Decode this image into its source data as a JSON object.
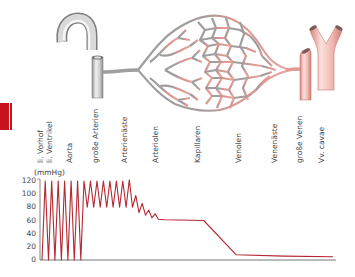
{
  "diagram": {
    "title_hint": "Blutdruck im Kreislauf",
    "vessel_labels": [
      {
        "id": "vorhof",
        "text": "li. Vorhof",
        "x": 40
      },
      {
        "id": "ventrikel",
        "text": "li. Ventrikel",
        "x": 49
      },
      {
        "id": "aorta",
        "text": "Aorta",
        "x": 69
      },
      {
        "id": "grosse-arterien",
        "text": "große Arterien",
        "x": 95
      },
      {
        "id": "arterienaeste",
        "text": "Arterienäste",
        "x": 124
      },
      {
        "id": "arteriolen",
        "text": "Arteriolen",
        "x": 155
      },
      {
        "id": "kapillaren",
        "text": "Kapillaren",
        "x": 197
      },
      {
        "id": "venolen",
        "text": "Venolen",
        "x": 238
      },
      {
        "id": "venenaeste",
        "text": "Venenäste",
        "x": 274
      },
      {
        "id": "grosse-venen",
        "text": "große Venen",
        "x": 299
      },
      {
        "id": "vv-cavae",
        "text": "Vv. cavae",
        "x": 321
      }
    ],
    "colors": {
      "accent_red": "#c8141e",
      "pressure_line": "#b42832",
      "arterial_gray": "#9a9a9a",
      "venous_pink": "#e39a93",
      "axis": "#666666"
    }
  },
  "chart_data": {
    "type": "line",
    "title": "",
    "xlabel": "",
    "ylabel": "(mmHg)",
    "ylim": [
      0,
      120
    ],
    "yticks": [
      0,
      20,
      40,
      60,
      80,
      100,
      120
    ],
    "grid": false,
    "x_segments": [
      "li. Vorhof / li. Ventrikel",
      "Aorta",
      "große Arterien",
      "Arterienäste",
      "Arteriolen",
      "Kapillaren",
      "Venolen",
      "Venenäste",
      "große Venen",
      "Vv. cavae"
    ],
    "series": [
      {
        "name": "Blutdruck",
        "description": "Ventricle oscillates 0–120 mmHg; aorta/large arteries oscillate 80–120; damped in arterial branches to ~65; arterioles drop to ~60 then linear fall in capillaries to ~10; veins ~10 falling to ~5 at vena cava",
        "points": [
          [
            0,
            0
          ],
          [
            1,
            120
          ],
          [
            2,
            0
          ],
          [
            3,
            120
          ],
          [
            4,
            0
          ],
          [
            5,
            120
          ],
          [
            6,
            0
          ],
          [
            7,
            120
          ],
          [
            8,
            0
          ],
          [
            9,
            120
          ],
          [
            10,
            0
          ],
          [
            11,
            120
          ],
          [
            12,
            0
          ],
          [
            13,
            120
          ],
          [
            14,
            80
          ],
          [
            15,
            120
          ],
          [
            16,
            80
          ],
          [
            17,
            120
          ],
          [
            18,
            80
          ],
          [
            19,
            120
          ],
          [
            20,
            80
          ],
          [
            21,
            120
          ],
          [
            22,
            80
          ],
          [
            23,
            120
          ],
          [
            24,
            80
          ],
          [
            25,
            120
          ],
          [
            26,
            80
          ],
          [
            27,
            122
          ],
          [
            28,
            80
          ],
          [
            29,
            98
          ],
          [
            30,
            72
          ],
          [
            31,
            86
          ],
          [
            32,
            68
          ],
          [
            33,
            76
          ],
          [
            34,
            64
          ],
          [
            35,
            70
          ],
          [
            36,
            62
          ],
          [
            38,
            61
          ],
          [
            50,
            60
          ],
          [
            60,
            8
          ],
          [
            75,
            6
          ],
          [
            90,
            5
          ]
        ]
      }
    ]
  },
  "axis": {
    "unit": "(mmHg)",
    "ticks": [
      "120",
      "100",
      "80",
      "60",
      "40",
      "20",
      "0"
    ]
  }
}
